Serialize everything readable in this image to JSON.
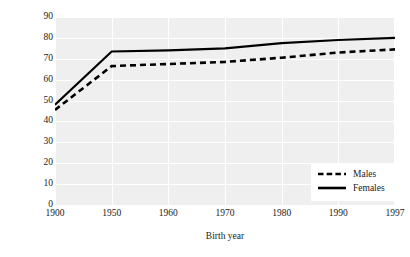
{
  "chart_data": {
    "type": "line",
    "title": "",
    "xlabel": "Birth year",
    "ylabel": "Average longevity",
    "categories": [
      "1900",
      "1950",
      "1960",
      "1970",
      "1980",
      "1990",
      "1997"
    ],
    "series": [
      {
        "name": "Males",
        "style": "dashed",
        "color": "#000000",
        "values": [
          45.5,
          66.5,
          67.5,
          68.5,
          70.5,
          73.0,
          74.5
        ]
      },
      {
        "name": "Females",
        "style": "solid",
        "color": "#000000",
        "values": [
          48.0,
          73.5,
          74.0,
          75.0,
          77.5,
          79.0,
          80.0
        ]
      }
    ],
    "ylim": [
      0,
      90
    ],
    "yticks": [
      "0",
      "10",
      "20",
      "30",
      "40",
      "50",
      "60",
      "70",
      "80",
      "90"
    ],
    "grid": true,
    "grid_color": "#ffffff",
    "plot_background": "#efeff0",
    "legend_position": "bottom-right",
    "legend_background": "#ffffff"
  },
  "legend": {
    "entries": [
      {
        "label": "Males"
      },
      {
        "label": "Females"
      }
    ]
  }
}
